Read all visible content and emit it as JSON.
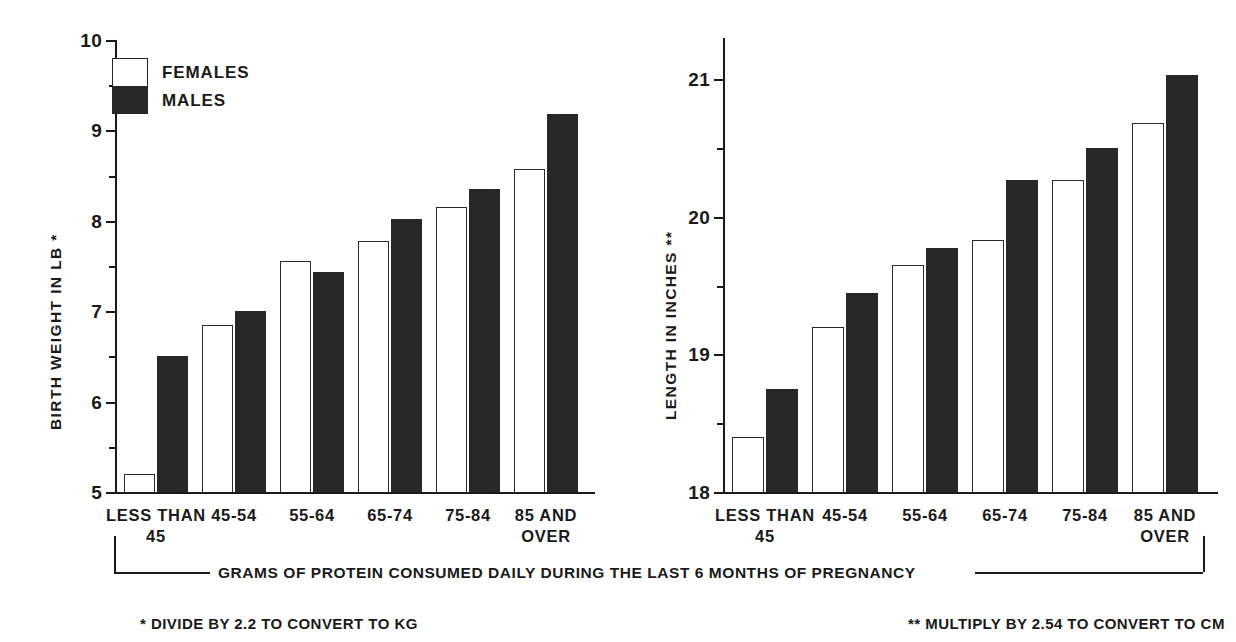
{
  "chart_data": [
    {
      "type": "bar",
      "id": "birth-weight",
      "title": "",
      "xlabel": "GRAMS OF PROTEIN CONSUMED DAILY DURING THE LAST 6 MONTHS OF PREGNANCY",
      "ylabel": "BIRTH WEIGHT IN LB *",
      "ylim": [
        5,
        10
      ],
      "ytick_labels": [
        "10",
        "9",
        "8",
        "7",
        "6",
        "5"
      ],
      "yticks": [
        10,
        9,
        8,
        7,
        6,
        5
      ],
      "minor_ticks": [
        9.5,
        8.5,
        7.5,
        6.5,
        5.5
      ],
      "grid": false,
      "legend_position": "inside-top-left",
      "categories": [
        "LESS THAN 45",
        "45-54",
        "55-64",
        "65-74",
        "75-84",
        "85 AND OVER"
      ],
      "category_lines": [
        [
          "LESS THAN",
          "45"
        ],
        [
          "45-54",
          ""
        ],
        [
          "55-64",
          ""
        ],
        [
          "65-74",
          ""
        ],
        [
          "75-84",
          ""
        ],
        [
          "85 AND",
          "OVER"
        ]
      ],
      "series": [
        {
          "name": "FEMALES",
          "values": [
            5.2,
            6.85,
            7.55,
            7.78,
            8.15,
            8.57
          ]
        },
        {
          "name": "MALES",
          "values": [
            6.5,
            7.0,
            7.43,
            8.02,
            8.35,
            9.18
          ]
        }
      ],
      "footnote": "* DIVIDE BY 2.2 TO CONVERT TO KG"
    },
    {
      "type": "bar",
      "id": "length",
      "title": "",
      "xlabel": "GRAMS OF PROTEIN CONSUMED DAILY DURING THE LAST 6 MONTHS OF PREGNANCY",
      "ylabel": "LENGTH IN INCHES **",
      "ylim": [
        18,
        21.3
      ],
      "ytick_labels": [
        "21",
        "20",
        "19",
        "18"
      ],
      "yticks": [
        21,
        20,
        19,
        18
      ],
      "minor_ticks": [
        20.5,
        19.5,
        18.5
      ],
      "grid": false,
      "legend_position": "none",
      "categories": [
        "LESS THAN 45",
        "45-54",
        "55-64",
        "65-74",
        "75-84",
        "85 AND OVER"
      ],
      "category_lines": [
        [
          "LESS THAN",
          "45"
        ],
        [
          "45-54",
          ""
        ],
        [
          "55-64",
          ""
        ],
        [
          "65-74",
          ""
        ],
        [
          "75-84",
          ""
        ],
        [
          "85 AND",
          "OVER"
        ]
      ],
      "series": [
        {
          "name": "FEMALES",
          "values": [
            18.4,
            19.2,
            19.65,
            19.83,
            20.27,
            20.68
          ]
        },
        {
          "name": "MALES",
          "values": [
            18.75,
            19.45,
            19.77,
            20.27,
            20.5,
            21.03
          ]
        }
      ],
      "footnote": "** MULTIPLY BY 2.54 TO CONVERT TO CM"
    }
  ],
  "legend": {
    "females_label": "FEMALES",
    "males_label": "MALES"
  },
  "caption": {
    "text": "GRAMS OF PROTEIN CONSUMED DAILY DURING THE LAST 6 MONTHS OF PREGNANCY"
  },
  "footnotes": {
    "left": "* DIVIDE BY 2.2 TO CONVERT TO KG",
    "right": "** MULTIPLY BY 2.54 TO CONVERT TO CM"
  },
  "colors": {
    "female_fill": "#ffffff",
    "female_stroke": "#2b2b2b",
    "male_fill": "#272727",
    "axis": "#1a1a1a",
    "background": "#ffffff"
  }
}
